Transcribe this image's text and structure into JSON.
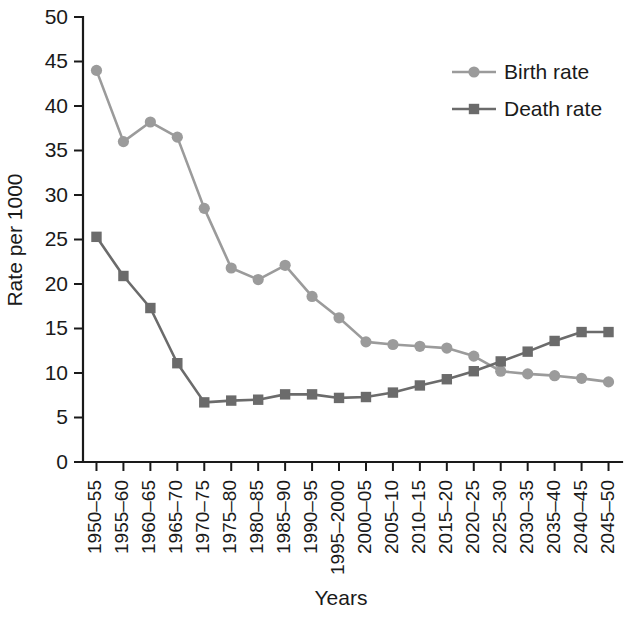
{
  "chart_data": {
    "type": "line",
    "title": "",
    "xlabel": "Years",
    "ylabel": "Rate per 1000",
    "ylim": [
      0,
      50
    ],
    "yticks": [
      0,
      5,
      10,
      15,
      20,
      25,
      30,
      35,
      40,
      45,
      50
    ],
    "grid": false,
    "legend_position": "top-right",
    "categories": [
      "1950–55",
      "1955–60",
      "1960–65",
      "1965–70",
      "1970–75",
      "1975–80",
      "1980–85",
      "1985–90",
      "1990–95",
      "1995–2000",
      "2000–05",
      "2005–10",
      "2010–15",
      "2015–20",
      "2020–25",
      "2025–30",
      "2030–35",
      "2035–40",
      "2040–45",
      "2045–50"
    ],
    "series": [
      {
        "name": "Birth rate",
        "marker": "circle",
        "color": "#9b9b9b",
        "values": [
          44.0,
          36.0,
          38.2,
          36.5,
          28.5,
          21.8,
          20.5,
          22.1,
          18.6,
          16.2,
          13.5,
          13.2,
          13.0,
          12.8,
          11.9,
          10.2,
          9.9,
          9.7,
          9.4,
          9.0
        ]
      },
      {
        "name": "Death rate",
        "marker": "square",
        "color": "#6b6b6b",
        "values": [
          25.3,
          20.9,
          17.3,
          11.1,
          6.7,
          6.9,
          7.0,
          7.6,
          7.6,
          7.2,
          7.3,
          7.8,
          8.6,
          9.3,
          10.2,
          11.3,
          12.4,
          13.6,
          14.6,
          14.6
        ]
      }
    ]
  },
  "legend": {
    "items": [
      {
        "label": "Birth rate",
        "marker": "circle-marker",
        "color": "#9b9b9b"
      },
      {
        "label": "Death rate",
        "marker": "square-marker",
        "color": "#6b6b6b"
      }
    ]
  },
  "axes": {
    "y_title": "Rate per 1000",
    "x_title": "Years"
  }
}
